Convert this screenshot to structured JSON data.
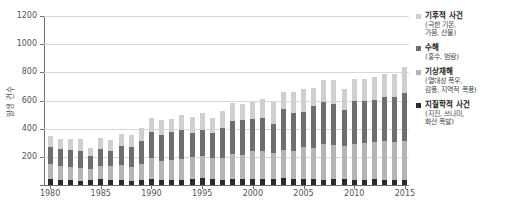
{
  "chart_data": {
    "type": "bar",
    "stacked": true,
    "title": "",
    "xlabel": "",
    "ylabel": "발생 건수",
    "ylim": [
      0,
      1200
    ],
    "ytick_values": [
      0,
      200,
      400,
      600,
      800,
      1000,
      1200
    ],
    "ytick_labels": [
      "0",
      "200",
      "400",
      "600",
      "800",
      "1000",
      "1200"
    ],
    "grid": true,
    "legend_position": "right",
    "xtick_labels": [
      "1980",
      "1985",
      "1990",
      "1995",
      "2000",
      "2005",
      "2010",
      "2015"
    ],
    "categories": [
      "1980",
      "1981",
      "1982",
      "1983",
      "1984",
      "1985",
      "1986",
      "1987",
      "1988",
      "1989",
      "1990",
      "1991",
      "1992",
      "1993",
      "1994",
      "1995",
      "1996",
      "1997",
      "1998",
      "1999",
      "2000",
      "2001",
      "2002",
      "2003",
      "2004",
      "2005",
      "2006",
      "2007",
      "2008",
      "2009",
      "2010",
      "2011",
      "2012",
      "2013",
      "2014",
      "2015"
    ],
    "series": [
      {
        "name": "지질학적 사건",
        "sub": "(지진, 쓰나미, 화산 폭발)",
        "color": "#2b2b2b",
        "values": [
          42,
          38,
          35,
          30,
          34,
          40,
          33,
          36,
          30,
          38,
          40,
          34,
          36,
          38,
          45,
          48,
          40,
          38,
          42,
          45,
          46,
          43,
          40,
          48,
          44,
          42,
          40,
          38,
          42,
          40,
          38,
          36,
          40,
          38,
          36,
          38
        ]
      },
      {
        "name": "기상재해",
        "sub": "(열대성 폭우, 감풍, 지역적 폭풍)",
        "color": "#b5b5b5",
        "values": [
          105,
          100,
          95,
          90,
          80,
          95,
          100,
          105,
          95,
          110,
          150,
          140,
          145,
          150,
          155,
          160,
          150,
          155,
          175,
          165,
          195,
          200,
          185,
          200,
          195,
          230,
          220,
          250,
          245,
          240,
          250,
          260,
          265,
          275,
          270,
          275
        ]
      },
      {
        "name": "수해",
        "sub": "(홍수, 범람)",
        "color": "#6e6e6e",
        "values": [
          120,
          115,
          120,
          125,
          95,
          120,
          110,
          135,
          145,
          165,
          185,
          180,
          195,
          205,
          170,
          180,
          180,
          215,
          240,
          255,
          230,
          230,
          210,
          290,
          270,
          245,
          300,
          300,
          285,
          250,
          310,
          300,
          300,
          310,
          320,
          340
        ]
      },
      {
        "name": "기후적 사건",
        "sub": "(극한 기온, 가뭄, 산불)",
        "color": "#cfcfcf",
        "values": [
          80,
          75,
          75,
          80,
          55,
          80,
          80,
          85,
          85,
          95,
          100,
          110,
          95,
          105,
          110,
          120,
          105,
          115,
          125,
          110,
          120,
          135,
          155,
          120,
          155,
          165,
          130,
          160,
          175,
          150,
          155,
          155,
          160,
          165,
          160,
          185
        ]
      }
    ]
  },
  "legend": {
    "items": [
      {
        "title": "기후적 사건",
        "sub_line1": "(극한 기온,",
        "sub_line2": "가뭄, 산불)",
        "color": "#cfcfcf"
      },
      {
        "title": "수해",
        "sub_line1": "(홍수, 범람)",
        "sub_line2": "",
        "color": "#6e6e6e"
      },
      {
        "title": "기상재해",
        "sub_line1": "(열대성 폭우,",
        "sub_line2": "감풍, 지역적 폭풍)",
        "color": "#b5b5b5"
      },
      {
        "title": "지질학적 사건",
        "sub_line1": "(지진, 쓰나미,",
        "sub_line2": "화산 폭발)",
        "color": "#2b2b2b"
      }
    ]
  }
}
